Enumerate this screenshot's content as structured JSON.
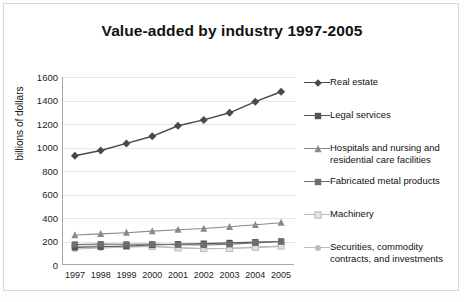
{
  "title": "Value-added by industry  1997-2005",
  "axes": {
    "ylabel": "billions of dollars",
    "yticks": [
      "1600",
      "1400",
      "1200",
      "1000",
      "800",
      "600",
      "400",
      "200",
      "0"
    ],
    "xticks": [
      "1997",
      "1998",
      "1999",
      "2000",
      "2001",
      "2002",
      "2003",
      "2004",
      "2005"
    ]
  },
  "legend": {
    "items": [
      {
        "label": "Real estate",
        "marker": "diamond",
        "color": "#4a4a4a"
      },
      {
        "label": "Legal services",
        "marker": "square",
        "color": "#555555"
      },
      {
        "label": "Hospitals and nursing and\nresidential care facilities",
        "marker": "triangle",
        "color": "#8a8a8a"
      },
      {
        "label": "Fabricated metal products",
        "marker": "square",
        "color": "#6e6e6e"
      },
      {
        "label": "Machinery",
        "marker": "square-open",
        "color": "#b9b9b9"
      },
      {
        "label": "Securities, commodity\ncontracts, and investments",
        "marker": "circle",
        "color": "#bdbdbd"
      }
    ]
  },
  "chart_data": {
    "type": "line",
    "title": "Value-added by industry  1997-2005",
    "xlabel": "",
    "ylabel": "billions of dollars",
    "ylim": [
      0,
      1600
    ],
    "ytick_step": 200,
    "grid": true,
    "legend_position": "right",
    "categories": [
      "1997",
      "1998",
      "1999",
      "2000",
      "2001",
      "2002",
      "2003",
      "2004",
      "2005"
    ],
    "series": [
      {
        "name": "Real estate",
        "marker": "diamond",
        "color": "#4a4a4a",
        "values": [
          930,
          975,
          1035,
          1095,
          1185,
          1235,
          1295,
          1390,
          1475
        ]
      },
      {
        "name": "Legal services",
        "marker": "square",
        "color": "#555555",
        "values": [
          150,
          155,
          162,
          170,
          178,
          182,
          188,
          195,
          200
        ]
      },
      {
        "name": "Hospitals and nursing and residential care facilities",
        "marker": "triangle",
        "color": "#8a8a8a",
        "values": [
          255,
          265,
          275,
          288,
          300,
          310,
          325,
          342,
          360
        ]
      },
      {
        "name": "Fabricated metal products",
        "marker": "square",
        "color": "#6e6e6e",
        "values": [
          175,
          178,
          176,
          178,
          172,
          170,
          176,
          188,
          200
        ]
      },
      {
        "name": "Machinery",
        "marker": "square-open",
        "color": "#b9b9b9",
        "values": [
          160,
          162,
          158,
          158,
          146,
          140,
          142,
          152,
          162
        ]
      },
      {
        "name": "Securities, commodity contracts, and investments",
        "marker": "circle",
        "color": "#bdbdbd",
        "values": [
          135,
          145,
          152,
          158,
          148,
          138,
          140,
          148,
          158
        ]
      }
    ]
  }
}
